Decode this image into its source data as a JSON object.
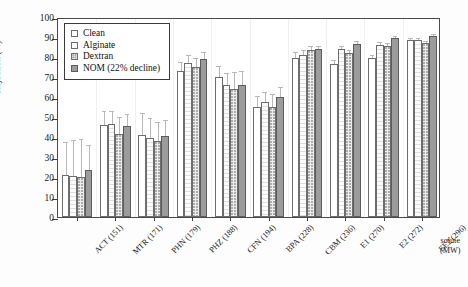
{
  "chart_data": {
    "type": "bar",
    "title": "",
    "xlabel": "solute (MW)",
    "ylabel": "Rejection (%)",
    "ylim": [
      0,
      100
    ],
    "ytick_step": 10,
    "grid": false,
    "legend_position": "upper-left-inside",
    "categories": [
      "ACT (151)",
      "MTR (171)",
      "PHN (179)",
      "PHZ (188)",
      "CFN (194)",
      "BPA (228)",
      "CBM (236)",
      "E1 (270)",
      "E2 (272)",
      "EE2 (296)"
    ],
    "yticks": [
      "0",
      "10",
      "20",
      "30",
      "40",
      "50",
      "60",
      "70",
      "80",
      "90",
      "100"
    ],
    "series": [
      {
        "name": "Clean",
        "values": [
          21.0,
          46.0,
          41.2,
          73.1,
          69.8,
          55.0,
          79.6,
          76.6,
          79.7,
          88.7
        ],
        "errors": [
          17.5,
          8.0,
          12.0,
          5.5,
          6.5,
          6.5,
          4.0,
          3.0,
          2.5,
          2.0
        ]
      },
      {
        "name": "Alginate",
        "values": [
          20.6,
          46.6,
          39.4,
          77.0,
          66.1,
          57.6,
          80.9,
          84.1,
          85.9,
          88.4
        ],
        "errors": [
          19.0,
          7.5,
          11.0,
          5.0,
          7.0,
          6.0,
          3.5,
          2.5,
          2.5,
          2.0
        ]
      },
      {
        "name": "Dextran",
        "values": [
          19.8,
          41.7,
          38.0,
          75.1,
          63.9,
          55.2,
          83.3,
          82.0,
          85.3,
          86.9
        ],
        "errors": [
          20.0,
          9.5,
          10.5,
          5.5,
          9.5,
          7.5,
          3.0,
          2.5,
          2.5,
          2.0
        ]
      },
      {
        "name": "NOM (22% decline)",
        "values": [
          23.3,
          45.5,
          40.3,
          79.1,
          66.0,
          59.8,
          84.1,
          86.3,
          89.5,
          90.3
        ],
        "errors": [
          13.5,
          7.0,
          9.0,
          4.5,
          8.0,
          6.0,
          2.5,
          2.5,
          2.0,
          2.0
        ]
      }
    ]
  },
  "legend": {
    "items": [
      {
        "label": "Clean"
      },
      {
        "label": "Alginate"
      },
      {
        "label": "Dextran"
      },
      {
        "label": "NOM (22% decline)"
      }
    ]
  }
}
